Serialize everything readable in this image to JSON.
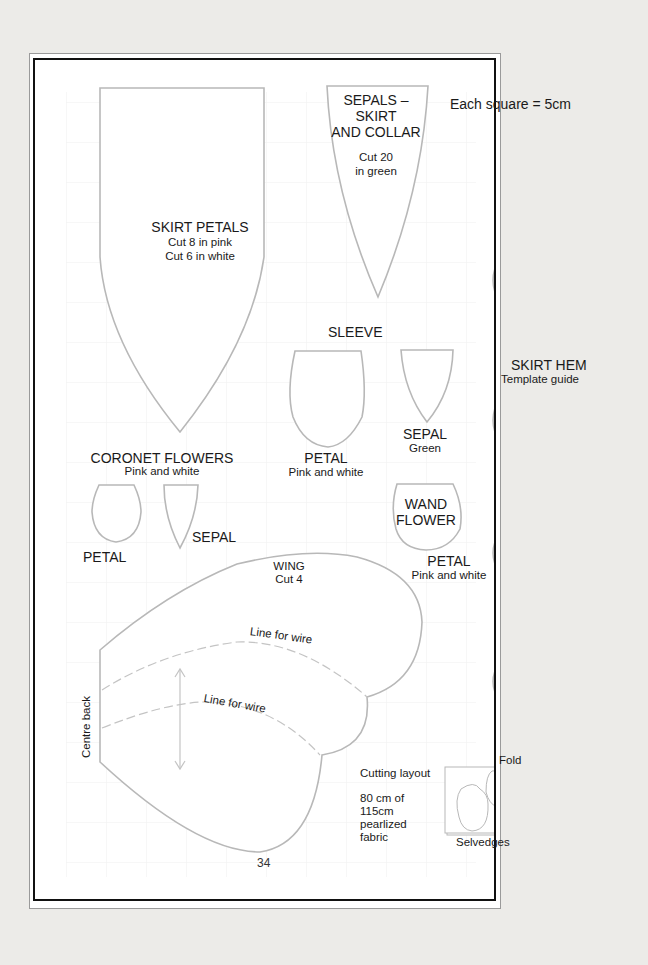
{
  "page": {
    "scale_note": "Each square = 5cm",
    "page_number": "34"
  },
  "pieces": {
    "skirt_petals": {
      "title": "SKIRT PETALS",
      "line1": "Cut 8 in pink",
      "line2": "Cut 6 in white"
    },
    "sepals": {
      "title1": "SEPALS –",
      "title2": "SKIRT",
      "title3": "AND COLLAR",
      "line1": "Cut 20",
      "line2": "in green"
    },
    "sleeve": {
      "title": "SLEEVE"
    },
    "sleeve_petal": {
      "title": "PETAL",
      "sub": "Pink and white"
    },
    "sleeve_sepal": {
      "title": "SEPAL",
      "sub": "Green"
    },
    "coronet": {
      "title": "CORONET FLOWERS",
      "sub": "Pink and white",
      "petal": "PETAL",
      "sepal": "SEPAL"
    },
    "wand_flower": {
      "title1": "WAND",
      "title2": "FLOWER",
      "petal": "PETAL",
      "sub": "Pink and white"
    },
    "skirt_hem": {
      "title": "SKIRT HEM",
      "sub": "Template guide"
    },
    "wing": {
      "title": "WING",
      "sub": "Cut 4",
      "wire1": "Line for wire",
      "wire2": "Line for wire",
      "centre_back": "Centre back"
    },
    "cutting_layout": {
      "title": "Cutting layout",
      "line1": "80 cm of",
      "line2": "115cm",
      "line3": "pearlized",
      "line4": "fabric",
      "fold": "Fold",
      "selvedges": "Selvedges"
    }
  },
  "colors": {
    "outline": "#b8b8b8",
    "grid": "#f0f0f0",
    "border": "#111111",
    "text": "#1a1a1a"
  }
}
